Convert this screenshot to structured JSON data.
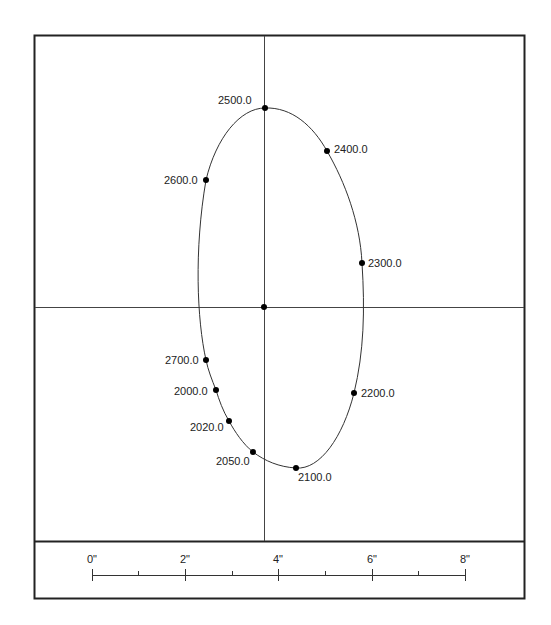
{
  "plot": {
    "frame": {
      "x": 34,
      "y": 35,
      "w": 490,
      "h": 563,
      "divider_y": 541
    },
    "crosshair": {
      "cx": 264,
      "cy": 307
    },
    "curve_color": "#333333",
    "points": [
      {
        "label": "2500.0",
        "x": 265,
        "y": 108,
        "lx": 218,
        "ly": 104
      },
      {
        "label": "2400.0",
        "x": 327,
        "y": 151,
        "lx": 334,
        "ly": 153
      },
      {
        "label": "2600.0",
        "x": 206,
        "y": 180,
        "lx": 164,
        "ly": 184
      },
      {
        "label": "2300.0",
        "x": 362,
        "y": 263,
        "lx": 368,
        "ly": 267
      },
      {
        "label": "2700.0",
        "x": 206,
        "y": 360,
        "lx": 165,
        "ly": 364
      },
      {
        "label": "2000.0",
        "x": 216,
        "y": 390,
        "lx": 174,
        "ly": 395
      },
      {
        "label": "2200.0",
        "x": 354,
        "y": 393,
        "lx": 361,
        "ly": 397
      },
      {
        "label": "2020.0",
        "x": 229,
        "y": 421,
        "lx": 190,
        "ly": 431
      },
      {
        "label": "2050.0",
        "x": 253,
        "y": 452,
        "lx": 216,
        "ly": 465
      },
      {
        "label": "2100.0",
        "x": 296,
        "y": 468,
        "lx": 298,
        "ly": 481
      }
    ]
  },
  "scale_bar": {
    "ticks": [
      {
        "label": "0\"",
        "x": 92
      },
      {
        "label": "2\"",
        "x": 185
      },
      {
        "label": "4\"",
        "x": 278
      },
      {
        "label": "6\"",
        "x": 372
      },
      {
        "label": "8\"",
        "x": 465
      }
    ],
    "minor_x": [
      138,
      232,
      325,
      418
    ],
    "y": 575
  }
}
